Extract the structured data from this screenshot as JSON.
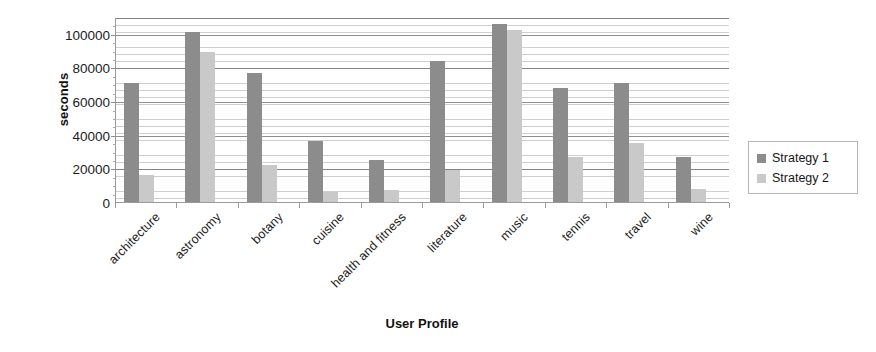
{
  "chart_data": {
    "type": "bar",
    "title": "",
    "xlabel": "User Profile",
    "ylabel": "seconds",
    "categories": [
      "architecture",
      "astronomy",
      "botany",
      "cuisine",
      "health and fitness",
      "literature",
      "music",
      "tennis",
      "travel",
      "wine"
    ],
    "series": [
      {
        "name": "Strategy 1",
        "color": "#8c8c8c",
        "values": [
          71000,
          101000,
          77000,
          36000,
          25000,
          84000,
          106000,
          68000,
          71000,
          27000
        ]
      },
      {
        "name": "Strategy 2",
        "color": "#c9c9c9",
        "values": [
          16000,
          89000,
          22000,
          6000,
          7000,
          19000,
          102000,
          26500,
          35000,
          8000
        ]
      }
    ],
    "ylim": [
      0,
      110000
    ],
    "yticks": [
      0,
      20000,
      40000,
      60000,
      80000,
      100000
    ],
    "ytick_labels": [
      "0",
      "20000",
      "40000",
      "60000",
      "80000",
      "100000"
    ],
    "grid": true,
    "legend_position": "right"
  },
  "legend": {
    "items": [
      {
        "label": "Strategy 1",
        "color": "#8c8c8c"
      },
      {
        "label": "Strategy 2",
        "color": "#c9c9c9"
      }
    ]
  }
}
